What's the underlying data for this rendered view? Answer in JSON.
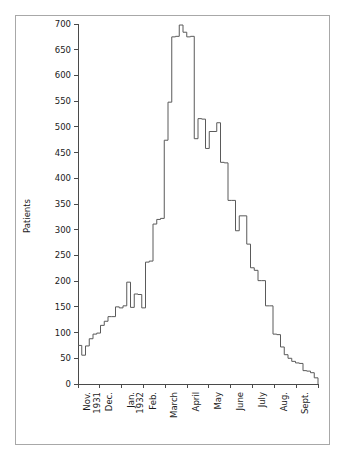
{
  "chart_data": {
    "type": "line",
    "variant": "step-histogram",
    "title": "",
    "subtitle": "",
    "xlabel": "",
    "ylabel": "Patients",
    "ylim": [
      0,
      700
    ],
    "ytick_labels": [
      "0",
      "50",
      "100",
      "150",
      "200",
      "250",
      "300",
      "350",
      "400",
      "450",
      "500",
      "550",
      "600",
      "650",
      "700"
    ],
    "ytick_values": [
      0,
      50,
      100,
      150,
      200,
      250,
      300,
      350,
      400,
      450,
      500,
      550,
      600,
      650,
      700
    ],
    "ytick_step": 50,
    "grid": false,
    "legend": null,
    "x_month_labels": [
      "Nov.\n1931",
      "Dec.",
      "Jan.\n1932",
      "Feb.",
      "March",
      "April",
      "May",
      "June",
      "July",
      "Aug.",
      "Sept."
    ],
    "x_month_labels_flat": [
      "Nov. 1931",
      "Dec.",
      "Jan. 1932",
      "Feb.",
      "March",
      "April",
      "May",
      "June",
      "July",
      "Aug.",
      "Sept."
    ],
    "x_axis_start": "November 1931",
    "x_axis_end": "September 1932",
    "x_units": "weeks",
    "bin_count": 46,
    "values": [
      75,
      56,
      74,
      88,
      97,
      99,
      114,
      122,
      131,
      131,
      150,
      148,
      152,
      198,
      149,
      175,
      174,
      148,
      237,
      239,
      311,
      320,
      322,
      474,
      548,
      675,
      676,
      698,
      684,
      675,
      676,
      477,
      516,
      515,
      458,
      491,
      491,
      508,
      431,
      430,
      357,
      357,
      298,
      327,
      327,
      272
    ],
    "series_name": "Patients per week",
    "peak_value": 698,
    "minimum_value": 12,
    "tail_values": [
      272,
      226,
      221,
      201,
      201,
      152,
      152,
      97,
      96,
      72,
      57,
      50,
      44,
      41,
      40,
      26,
      25,
      22,
      12
    ]
  },
  "axes": {
    "ylabel": "Patients",
    "ytick_labels": [
      "700",
      "650",
      "600",
      "550",
      "500",
      "450",
      "400",
      "350",
      "300",
      "250",
      "200",
      "150",
      "100",
      "50",
      "0"
    ],
    "xtick_labels": [
      "Nov. 1931",
      "Dec.",
      "Jan. 1932",
      "Feb.",
      "March",
      "April",
      "May",
      "June",
      "July",
      "Aug.",
      "Sept."
    ]
  },
  "colors": {
    "curve": "#5a5a5a",
    "axis": "#4a4a4a",
    "text": "#1a1a1a",
    "frame": "#a8a8a8",
    "background": "#ffffff"
  }
}
